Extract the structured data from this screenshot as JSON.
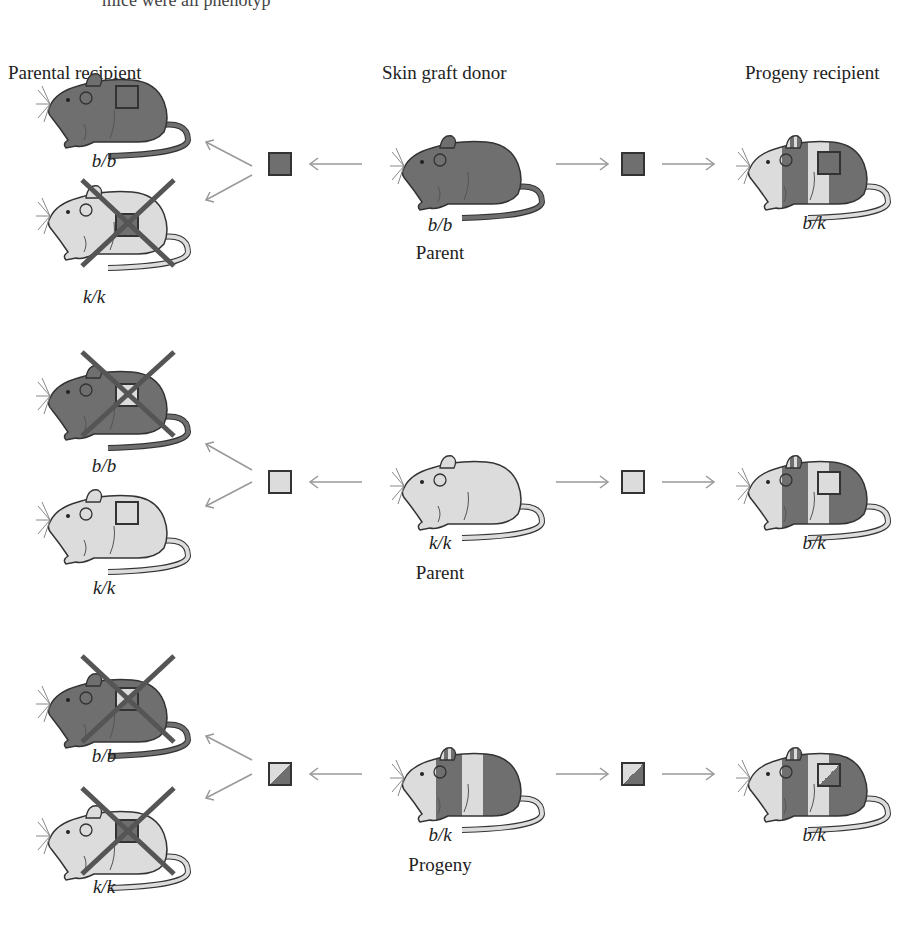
{
  "caption_fragment": "mice were all phenotyp",
  "headers": {
    "parental_recipient": "Parental recipient",
    "skin_graft_donor": "Skin graft donor",
    "progeny_recipient": "Progeny recipient"
  },
  "colors": {
    "dark_strain": "#6f6f6f",
    "light_strain": "#d9d9d9",
    "rejection_x": "#555555",
    "arrow": "#999999",
    "outline": "#333333"
  },
  "rows": [
    {
      "donor": {
        "genotype": "b/b",
        "role": "Parent",
        "coat": "dark"
      },
      "graft": "dark",
      "parental_recipients": [
        {
          "genotype": "b/b",
          "coat": "dark",
          "rejected": false
        },
        {
          "genotype": "k/k",
          "coat": "light",
          "rejected": true
        }
      ],
      "progeny_recipient": {
        "genotype": "b/k",
        "coat": "mixed",
        "rejected": false
      }
    },
    {
      "donor": {
        "genotype": "k/k",
        "role": "Parent",
        "coat": "light"
      },
      "graft": "light",
      "parental_recipients": [
        {
          "genotype": "b/b",
          "coat": "dark",
          "rejected": true
        },
        {
          "genotype": "k/k",
          "coat": "light",
          "rejected": false
        }
      ],
      "progeny_recipient": {
        "genotype": "b/k",
        "coat": "mixed",
        "rejected": false
      }
    },
    {
      "donor": {
        "genotype": "b/k",
        "role": "Progeny",
        "coat": "mixed"
      },
      "graft": "mixed",
      "parental_recipients": [
        {
          "genotype": "b/b",
          "coat": "dark",
          "rejected": true
        },
        {
          "genotype": "k/k",
          "coat": "light",
          "rejected": true
        }
      ],
      "progeny_recipient": {
        "genotype": "b/k",
        "coat": "mixed",
        "rejected": false
      }
    }
  ]
}
